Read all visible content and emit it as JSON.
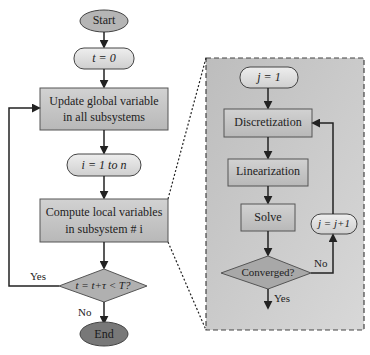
{
  "diagram": {
    "type": "flowchart",
    "colors": {
      "terminal_start": "#b9b9b9",
      "terminal_end": "#7a7a7a",
      "process_fill": "#c8c8c8",
      "oval_fill": "#dcdcdc",
      "panel_fill": "#c9c9c9",
      "stroke": "#333333"
    },
    "main": {
      "start": "Start",
      "init_t": "t = 0",
      "update": [
        "Update global variable",
        "in all subsystems"
      ],
      "loop_i": "i = 1 to n",
      "compute": [
        "Compute local variables",
        "in subsystem # i"
      ],
      "decision": "t = t+τ < T?",
      "yes_label": "Yes",
      "no_label": "No",
      "end": "End"
    },
    "detail": {
      "init_j": "j = 1",
      "step1": "Discretization",
      "step2": "Linearization",
      "step3": "Solve",
      "decision": "Converged?",
      "increment": "j = j+1",
      "no_label": "No",
      "yes_label": "Yes"
    }
  }
}
